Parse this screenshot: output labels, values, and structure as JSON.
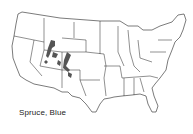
{
  "map": {
    "title": "Spruce, Blue",
    "region": "Contiguous United States",
    "shaded_range_color": "#555555",
    "outline_color": "#222222",
    "background_color": "#ffffff",
    "shaded_areas": [
      "Utah/Wyoming border region",
      "Western Colorado",
      "Southwestern Colorado",
      "Northern New Mexico/Arizona"
    ]
  }
}
